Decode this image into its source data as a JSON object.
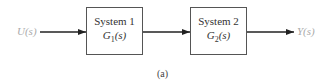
{
  "diagram": {
    "type": "block-diagram-series",
    "input_label": "U(s)",
    "output_label": "Y(s)",
    "blocks": [
      {
        "title": "System 1",
        "tf_main": "G",
        "tf_sub": "1",
        "tf_arg": "(s)"
      },
      {
        "title": "System 2",
        "tf_main": "G",
        "tf_sub": "2",
        "tf_arg": "(s)"
      }
    ],
    "caption": "(a)",
    "colors": {
      "line": "#222222",
      "signal_label": "#aaaaaa",
      "box_border": "#555555"
    }
  }
}
